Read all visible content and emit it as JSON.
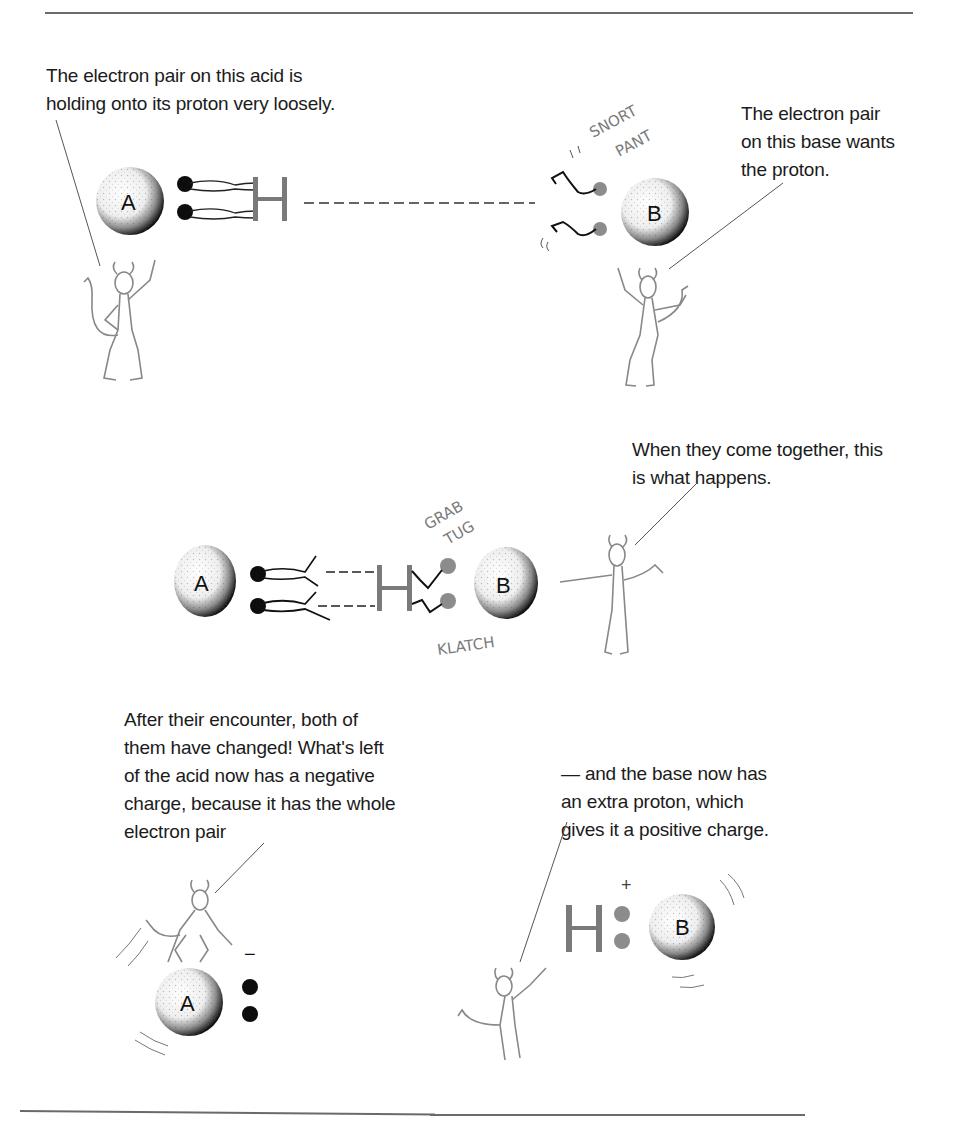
{
  "page": {
    "type": "textbook illustration"
  },
  "panels": [
    {
      "id": "panel-1",
      "captions": [
        {
          "id": "acid-caption",
          "text": "The electron pair on this acid is\nholding onto its proton very loosely."
        },
        {
          "id": "base-caption",
          "text": "The electron pair\non this base wants\nthe proton."
        }
      ],
      "atoms": [
        {
          "label": "A",
          "role": "acid"
        },
        {
          "label": "B",
          "role": "base"
        }
      ],
      "proton_label": "H",
      "sound_effects": [
        "SNORT",
        "PANT"
      ]
    },
    {
      "id": "panel-2",
      "captions": [
        {
          "id": "together-caption",
          "text": "When they come together, this\nis what happens."
        }
      ],
      "atoms": [
        {
          "label": "A",
          "role": "acid"
        },
        {
          "label": "B",
          "role": "base"
        }
      ],
      "proton_label": "H",
      "sound_effects": [
        "GRAB",
        "TUG",
        "KLATCH"
      ]
    },
    {
      "id": "panel-3",
      "captions": [
        {
          "id": "after-caption",
          "text": "After their encounter, both of\nthem have changed! What's left\nof the acid now has a negative\ncharge, because it has the whole\nelectron pair"
        },
        {
          "id": "base-now-caption",
          "text": "— and the base now has\nan extra proton, which\ngives it a positive charge."
        }
      ],
      "atoms": [
        {
          "label": "A",
          "role": "conjugate base",
          "charge": "−"
        },
        {
          "label": "B",
          "role": "conjugate acid",
          "charge": "+"
        }
      ],
      "proton_label": "H"
    }
  ],
  "colors": {
    "ink": "#111111",
    "gray_ink": "#7a7a7a",
    "rule": "#6a6a6a",
    "electron_black": "#0d0d0d",
    "electron_gray": "#8c8c8c"
  }
}
